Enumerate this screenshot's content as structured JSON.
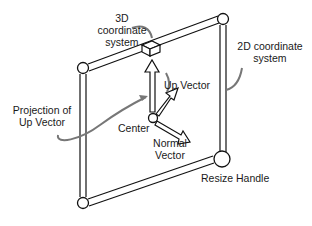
{
  "diagram": {
    "labels": {
      "coord3d": [
        "3D",
        "coordinate",
        "system"
      ],
      "coord2d": [
        "2D coordinate",
        "system"
      ],
      "up_vector": "Up Vector",
      "projection": [
        "Projection of",
        "Up Vector"
      ],
      "center": "Center",
      "normal": [
        "Normal",
        "Vector"
      ],
      "resize_handle": "Resize Handle"
    },
    "colors": {
      "stroke": "#111111",
      "callout": "#777777",
      "fill": "#ffffff"
    }
  }
}
